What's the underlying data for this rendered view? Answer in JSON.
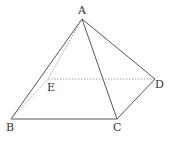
{
  "diagram": {
    "type": "square-pyramid",
    "colors": {
      "stroke": "#555555",
      "dashed": "#888888",
      "label": "#333333",
      "background": "#ffffff"
    },
    "vertices": [
      {
        "id": "A",
        "label": "A",
        "x": 82,
        "y": 19,
        "lx": 78,
        "ly": 14
      },
      {
        "id": "B",
        "label": "B",
        "x": 11,
        "y": 119,
        "lx": 6,
        "ly": 131
      },
      {
        "id": "C",
        "label": "C",
        "x": 117,
        "y": 119,
        "lx": 113,
        "ly": 131
      },
      {
        "id": "D",
        "label": "D",
        "x": 155,
        "y": 79,
        "lx": 155,
        "ly": 88
      },
      {
        "id": "E",
        "label": "E",
        "x": 48,
        "y": 79,
        "lx": 47,
        "ly": 91
      }
    ],
    "edges": [
      {
        "from": "A",
        "to": "B",
        "style": "solid"
      },
      {
        "from": "A",
        "to": "C",
        "style": "solid"
      },
      {
        "from": "A",
        "to": "D",
        "style": "solid"
      },
      {
        "from": "B",
        "to": "C",
        "style": "solid"
      },
      {
        "from": "C",
        "to": "D",
        "style": "solid"
      },
      {
        "from": "A",
        "to": "E",
        "style": "dashed"
      },
      {
        "from": "B",
        "to": "E",
        "style": "dashed"
      },
      {
        "from": "E",
        "to": "D",
        "style": "dashed"
      }
    ]
  }
}
